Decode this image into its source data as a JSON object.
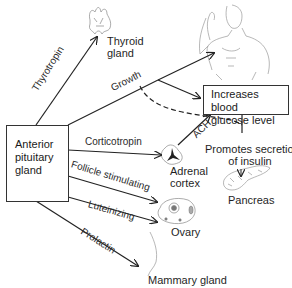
{
  "diagram": {
    "source_box": {
      "label_lines": [
        "Anterior",
        "pituitary",
        "gland"
      ]
    },
    "hormones": {
      "thyrotropin": "Thyrotropin",
      "growth": "Growth",
      "corticotropin": "Corticotropin",
      "follicle_stimulating": "Follicle stimulating",
      "luteinizing": "Luteinizing",
      "prolactin": "Prolactin",
      "ach": "ACH"
    },
    "targets": {
      "thyroid": [
        "Thyroid",
        "gland"
      ],
      "adrenal": [
        "Adrenal",
        "cortex"
      ],
      "ovary": "Ovary",
      "mammary": "Mammary gland",
      "pancreas": "Pancreas"
    },
    "effects": {
      "glucose_box": [
        "Increases blood",
        "glucose level"
      ],
      "insulin": [
        "Promotes secretion",
        "of insulin"
      ]
    },
    "colors": {
      "line": "#222222",
      "organ": "#888888",
      "text": "#1f1f1f"
    }
  }
}
